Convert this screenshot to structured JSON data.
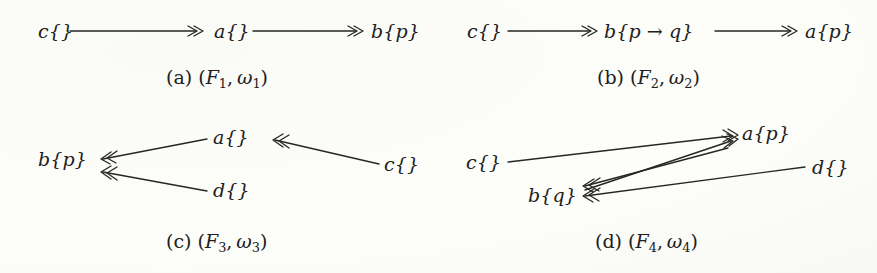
{
  "figure": {
    "background_color": "#fdfdfb",
    "ink_color": "#262626",
    "panel_count": 4
  },
  "panels": [
    {
      "id": "a",
      "caption": "(a) (F1, ω1)",
      "caption_label": "(a)",
      "caption_pair": "(F",
      "caption_sub1": "1",
      "caption_comma": ",ω",
      "caption_sub2": "1",
      "caption_close": ")",
      "nodes": [
        {
          "name": "node-c",
          "text": "c{}",
          "sym": "c",
          "set": "{}"
        },
        {
          "name": "node-a",
          "text": "a{}",
          "sym": "a",
          "set": "{}"
        },
        {
          "name": "node-b",
          "text": "b{p}",
          "sym": "b",
          "set": "{p}"
        }
      ],
      "edges": [
        {
          "from": "c{}",
          "to": "a{}",
          "arrow": "double-head"
        },
        {
          "from": "a{}",
          "to": "b{p}",
          "arrow": "double-head"
        }
      ]
    },
    {
      "id": "b",
      "caption": "(b) (F2, ω2)",
      "caption_label": "(b)",
      "caption_pair": "(F",
      "caption_sub1": "2",
      "caption_comma": ",ω",
      "caption_sub2": "2",
      "caption_close": ")",
      "nodes": [
        {
          "name": "node-c",
          "text": "c{}",
          "sym": "c",
          "set": "{}"
        },
        {
          "name": "node-b",
          "text": "b{p → q}",
          "sym": "b",
          "set": "{p → q}"
        },
        {
          "name": "node-a",
          "text": "a{p}",
          "sym": "a",
          "set": "{p}"
        }
      ],
      "edges": [
        {
          "from": "c{}",
          "to": "b{p → q}",
          "arrow": "double-head"
        },
        {
          "from": "b{p → q}",
          "to": "a{p}",
          "arrow": "double-head"
        }
      ]
    },
    {
      "id": "c",
      "caption": "(c) (F3, ω3)",
      "caption_label": "(c)",
      "caption_pair": "(F",
      "caption_sub1": "3",
      "caption_comma": ",ω",
      "caption_sub2": "3",
      "caption_close": ")",
      "nodes": [
        {
          "name": "node-b",
          "text": "b{p}",
          "sym": "b",
          "set": "{p}"
        },
        {
          "name": "node-a",
          "text": "a{}",
          "sym": "a",
          "set": "{}"
        },
        {
          "name": "node-d",
          "text": "d{}",
          "sym": "d",
          "set": "{}"
        },
        {
          "name": "node-c",
          "text": "c{}",
          "sym": "c",
          "set": "{}"
        }
      ],
      "edges": [
        {
          "from": "a{}",
          "to": "b{p}",
          "arrow": "double-head"
        },
        {
          "from": "d{}",
          "to": "b{p}",
          "arrow": "double-head"
        },
        {
          "from": "c{}",
          "to": "a{}",
          "arrow": "double-head"
        }
      ]
    },
    {
      "id": "d",
      "caption": "(d) (F4, ω4)",
      "caption_label": "(d)",
      "caption_pair": "(F",
      "caption_sub1": "4",
      "caption_comma": ",ω",
      "caption_sub2": "4",
      "caption_close": ")",
      "nodes": [
        {
          "name": "node-c",
          "text": "c{}",
          "sym": "c",
          "set": "{}"
        },
        {
          "name": "node-a",
          "text": "a{p}",
          "sym": "a",
          "set": "{p}"
        },
        {
          "name": "node-b",
          "text": "b{q}",
          "sym": "b",
          "set": "{q}"
        },
        {
          "name": "node-d",
          "text": "d{}",
          "sym": "d",
          "set": "{}"
        }
      ],
      "edges": [
        {
          "from": "c{}",
          "to": "a{p}",
          "arrow": "double-head"
        },
        {
          "from": "b{q}",
          "to": "a{p}",
          "arrow": "double-head"
        },
        {
          "from": "d{}",
          "to": "b{q}",
          "arrow": "double-head"
        },
        {
          "from": "a{p}",
          "to": "b{q}",
          "arrow": "double-head"
        }
      ]
    }
  ]
}
